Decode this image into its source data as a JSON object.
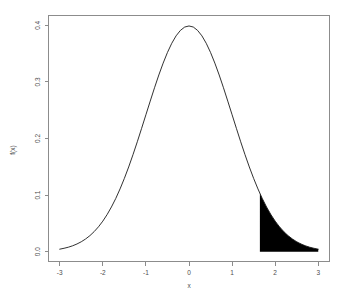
{
  "chart_data": {
    "type": "line",
    "title": "",
    "subtitle": "",
    "xlabel": "x",
    "ylabel": "f(x)",
    "xlim": [
      -3,
      3
    ],
    "ylim": [
      0.0,
      0.4
    ],
    "grid": false,
    "legend": null,
    "x_ticks": [
      "-3",
      "-2",
      "-1",
      "0",
      "1",
      "2",
      "3"
    ],
    "x_tick_values": [
      -3,
      -2,
      -1,
      0,
      1,
      2,
      3
    ],
    "y_ticks": [
      "0.0",
      "0.1",
      "0.2",
      "0.3",
      "0.4"
    ],
    "y_tick_values": [
      0.0,
      0.1,
      0.2,
      0.3,
      0.4
    ],
    "series": [
      {
        "name": "standard normal density",
        "color": "#1a1a1a",
        "x": [
          -3.0,
          -2.9,
          -2.8,
          -2.7,
          -2.6,
          -2.5,
          -2.4,
          -2.3,
          -2.2,
          -2.1,
          -2.0,
          -1.9,
          -1.8,
          -1.7,
          -1.6,
          -1.5,
          -1.4,
          -1.3,
          -1.2,
          -1.1,
          -1.0,
          -0.9,
          -0.8,
          -0.7,
          -0.6,
          -0.5,
          -0.4,
          -0.3,
          -0.2,
          -0.1,
          0.0,
          0.1,
          0.2,
          0.3,
          0.4,
          0.5,
          0.6,
          0.7,
          0.8,
          0.9,
          1.0,
          1.1,
          1.2,
          1.3,
          1.4,
          1.5,
          1.6,
          1.7,
          1.8,
          1.9,
          2.0,
          2.1,
          2.2,
          2.3,
          2.4,
          2.5,
          2.6,
          2.7,
          2.8,
          2.9,
          3.0
        ],
        "y": [
          0.0044,
          0.006,
          0.0079,
          0.0104,
          0.0136,
          0.0175,
          0.0224,
          0.0283,
          0.0355,
          0.044,
          0.054,
          0.0656,
          0.079,
          0.094,
          0.1109,
          0.1295,
          0.1497,
          0.1714,
          0.1942,
          0.2179,
          0.242,
          0.2661,
          0.2897,
          0.3123,
          0.3332,
          0.3521,
          0.3683,
          0.3814,
          0.391,
          0.397,
          0.3989,
          0.397,
          0.391,
          0.3814,
          0.3683,
          0.3521,
          0.3332,
          0.3123,
          0.2897,
          0.2661,
          0.242,
          0.2179,
          0.1942,
          0.1714,
          0.1497,
          0.1295,
          0.1109,
          0.094,
          0.079,
          0.0656,
          0.054,
          0.044,
          0.0355,
          0.0283,
          0.0224,
          0.0175,
          0.0136,
          0.0104,
          0.0079,
          0.006,
          0.0044
        ]
      }
    ],
    "shaded_region": {
      "name": "upper-tail-shaded-area",
      "color": "#000000",
      "x_start": 1.645,
      "x_end": 3.0,
      "y_baseline": 0.0
    }
  },
  "axes": {
    "x_title": "x",
    "y_title": "f(x)"
  }
}
